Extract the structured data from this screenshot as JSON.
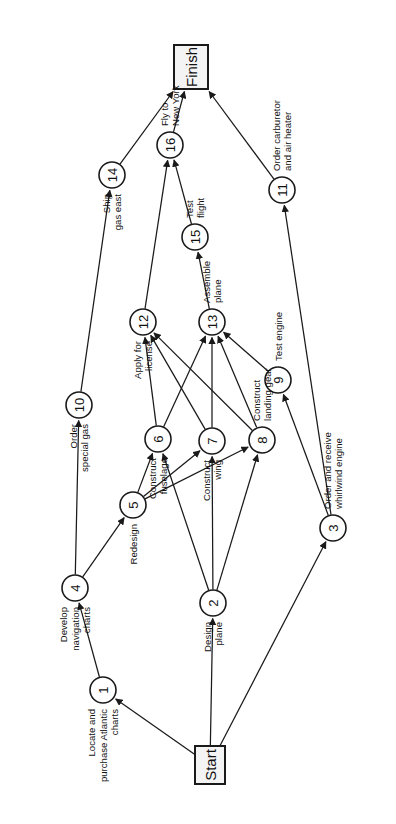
{
  "diagram": {
    "orientation": "rotated-90",
    "colors": {
      "stroke": "#1a1a1a",
      "node_fill": "#ffffff",
      "terminal_fill": "#f4f4f4",
      "background": "#ffffff"
    },
    "terminals": [
      {
        "id": "start",
        "label": "Start",
        "x": 210,
        "y": 765,
        "w": 30,
        "h": 38
      },
      {
        "id": "finish",
        "label": "Finish",
        "x": 191,
        "y": 67,
        "w": 34,
        "h": 44
      }
    ],
    "nodes": [
      {
        "id": "1",
        "num": "1",
        "x": 103,
        "y": 690,
        "label": "Locate and\npurchase Atlantic\ncharts",
        "lx": 103,
        "ly": 690,
        "anchor": "end",
        "side": "left"
      },
      {
        "id": "2",
        "num": "2",
        "x": 213,
        "y": 603,
        "label": "Design\nplane",
        "lx": 213,
        "ly": 603,
        "anchor": "end",
        "side": "left"
      },
      {
        "id": "3",
        "num": "3",
        "x": 333,
        "y": 528,
        "label": "Order and receive\nwhirlwind engine",
        "lx": 333,
        "ly": 528,
        "anchor": "start",
        "side": "right"
      },
      {
        "id": "4",
        "num": "4",
        "x": 75,
        "y": 588,
        "label": "Develop\nnavigation\ncharts",
        "lx": 75,
        "ly": 588,
        "anchor": "end",
        "side": "left"
      },
      {
        "id": "5",
        "num": "5",
        "x": 133,
        "y": 505,
        "label": "Redesign",
        "lx": 133,
        "ly": 505,
        "anchor": "end",
        "side": "left"
      },
      {
        "id": "6",
        "num": "6",
        "x": 158,
        "y": 439,
        "label": "Construct\nfuselage",
        "lx": 158,
        "ly": 439,
        "anchor": "end",
        "side": "left"
      },
      {
        "id": "7",
        "num": "7",
        "x": 212,
        "y": 441,
        "label": "Construct\nwing",
        "lx": 212,
        "ly": 441,
        "anchor": "end",
        "side": "left"
      },
      {
        "id": "8",
        "num": "8",
        "x": 262,
        "y": 440,
        "label": "Construct\nlanding gear",
        "lx": 262,
        "ly": 440,
        "anchor": "start",
        "side": "right"
      },
      {
        "id": "9",
        "num": "9",
        "x": 278,
        "y": 380,
        "label": "Test engine",
        "lx": 278,
        "ly": 380,
        "anchor": "start",
        "side": "right"
      },
      {
        "id": "10",
        "num": "10",
        "x": 79,
        "y": 405,
        "label": "Order\nspecial gas",
        "lx": 79,
        "ly": 405,
        "anchor": "end",
        "side": "left"
      },
      {
        "id": "11",
        "num": "11",
        "x": 282,
        "y": 190,
        "label": "Order carburetor\nand air heater",
        "lx": 282,
        "ly": 190,
        "anchor": "start",
        "side": "right"
      },
      {
        "id": "12",
        "num": "12",
        "x": 143,
        "y": 322,
        "label": "Apply for\nlicense",
        "lx": 143,
        "ly": 322,
        "anchor": "end",
        "side": "left"
      },
      {
        "id": "13",
        "num": "13",
        "x": 212,
        "y": 322,
        "label": "Assemble\nplane",
        "lx": 212,
        "ly": 322,
        "anchor": "start",
        "side": "right"
      },
      {
        "id": "14",
        "num": "14",
        "x": 112,
        "y": 175,
        "label": "Ship\ngas east",
        "lx": 112,
        "ly": 175,
        "anchor": "end",
        "side": "left"
      },
      {
        "id": "15",
        "num": "15",
        "x": 195,
        "y": 237,
        "label": "Test\nflight",
        "lx": 195,
        "ly": 237,
        "anchor": "start",
        "side": "right"
      },
      {
        "id": "16",
        "num": "16",
        "x": 170,
        "y": 145,
        "label": "Fly to\nNew York",
        "lx": 170,
        "ly": 145,
        "anchor": "start",
        "side": "right"
      }
    ],
    "edges": [
      {
        "from": "start",
        "to": "1"
      },
      {
        "from": "start",
        "to": "2"
      },
      {
        "from": "start",
        "to": "3"
      },
      {
        "from": "1",
        "to": "4"
      },
      {
        "from": "4",
        "to": "10"
      },
      {
        "from": "4",
        "to": "5"
      },
      {
        "from": "5",
        "to": "6"
      },
      {
        "from": "5",
        "to": "7"
      },
      {
        "from": "5",
        "to": "8"
      },
      {
        "from": "2",
        "to": "6"
      },
      {
        "from": "2",
        "to": "7"
      },
      {
        "from": "2",
        "to": "8"
      },
      {
        "from": "3",
        "to": "9"
      },
      {
        "from": "3",
        "to": "11"
      },
      {
        "from": "6",
        "to": "12"
      },
      {
        "from": "6",
        "to": "13"
      },
      {
        "from": "7",
        "to": "12"
      },
      {
        "from": "7",
        "to": "13"
      },
      {
        "from": "8",
        "to": "12"
      },
      {
        "from": "8",
        "to": "13"
      },
      {
        "from": "9",
        "to": "13"
      },
      {
        "from": "10",
        "to": "14"
      },
      {
        "from": "12",
        "to": "16"
      },
      {
        "from": "13",
        "to": "15"
      },
      {
        "from": "15",
        "to": "16"
      },
      {
        "from": "14",
        "to": "finish"
      },
      {
        "from": "16",
        "to": "finish"
      },
      {
        "from": "11",
        "to": "finish"
      }
    ]
  }
}
